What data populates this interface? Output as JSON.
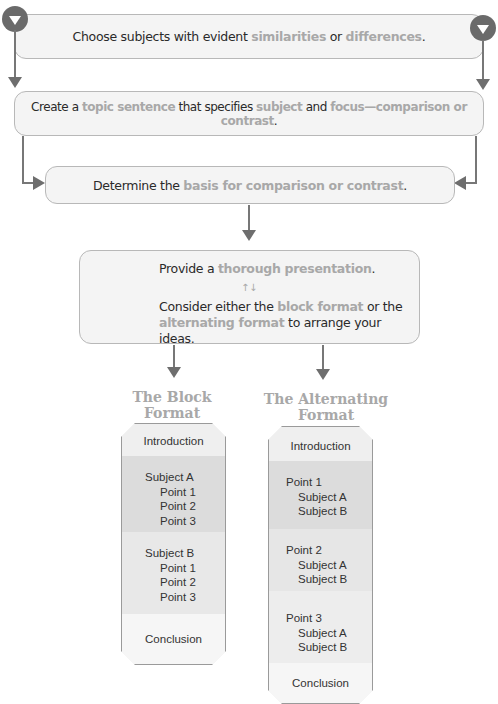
{
  "steps": [
    {
      "pre": "Choose subjects with evident ",
      "h1": "similarities",
      "mid": " or ",
      "h2": "differences",
      "post": "."
    },
    {
      "pre": "Create a ",
      "h1": "topic sentence",
      "mid": " that specifies ",
      "h2": "subject",
      "mid2": " and ",
      "h3": "focus—comparison or contrast",
      "post": "."
    },
    {
      "pre": "Determine the ",
      "h1": "basis for comparison or contrast",
      "post": "."
    },
    {
      "line1_pre": "Provide a ",
      "line1_h": "thorough presentation",
      "line1_post": ".",
      "swap_icon": "↑↓",
      "line2_pre": "Consider either the ",
      "line2_h1": "block format",
      "line2_mid": " or the",
      "line3_h2": "alternating format",
      "line3_post": " to arrange your ideas."
    }
  ],
  "block_format": {
    "title_line1": "The Block",
    "title_line2": "Format",
    "intro": "Introduction",
    "subject_a": "Subject A",
    "subject_a_points": [
      "Point 1",
      "Point 2",
      "Point 3"
    ],
    "subject_b": "Subject B",
    "subject_b_points": [
      "Point 1",
      "Point 2",
      "Point 3"
    ],
    "conclusion": "Conclusion"
  },
  "alternating_format": {
    "title_line1": "The Alternating",
    "title_line2": "Format",
    "intro": "Introduction",
    "points": [
      {
        "label": "Point 1",
        "subjects": [
          "Subject A",
          "Subject B"
        ]
      },
      {
        "label": "Point 2",
        "subjects": [
          "Subject A",
          "Subject B"
        ]
      },
      {
        "label": "Point 3",
        "subjects": [
          "Subject A",
          "Subject B"
        ]
      }
    ],
    "conclusion": "Conclusion"
  },
  "colors": {
    "highlight": "#a8a8a8",
    "box_bg": "#f4f4f4",
    "arrow": "#6e6e6e"
  }
}
